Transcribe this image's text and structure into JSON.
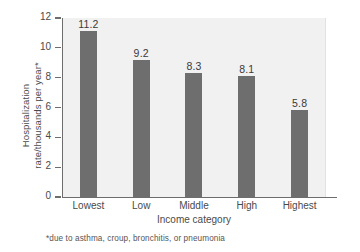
{
  "chart_data": {
    "type": "bar",
    "title": "",
    "categories": [
      "Lowest",
      "Low",
      "Middle",
      "High",
      "Highest"
    ],
    "values": [
      11.2,
      9.2,
      8.3,
      8.1,
      5.8
    ],
    "value_labels": [
      "11.2",
      "9.2",
      "8.3",
      "8.1",
      "5.8"
    ],
    "xlabel": "Income category",
    "ylabel_line1": "Hospitalization",
    "ylabel_line2": "rate/thousands per year*",
    "ylim": [
      0,
      12
    ],
    "yticks": [
      12,
      10,
      8,
      6,
      4,
      2,
      0
    ],
    "ytick_labels": [
      "12",
      "10",
      "8",
      "6",
      "4",
      "2",
      "0"
    ],
    "grid": false,
    "legend": "none",
    "footnote": "*due to asthma, croup, bronchitis, or pneumonia",
    "bar_color": "#6e6e6e",
    "plot_background": "#f1f1f1",
    "axis_color": "#6d6d6d"
  }
}
